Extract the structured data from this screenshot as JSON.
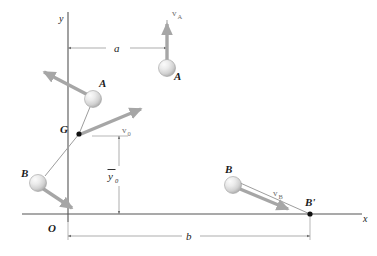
{
  "figure": {
    "background_color": "#ffffff",
    "axes": {
      "x_label": "x",
      "y_label": "y",
      "origin_label": "O",
      "axis_color": "#555555"
    },
    "points": [
      {
        "id": "G",
        "label": "G",
        "kind": "mass-center-dot",
        "x": 79,
        "y": 134
      },
      {
        "id": "Bprime",
        "label": "B'",
        "kind": "position-dot",
        "x": 310,
        "y": 216
      }
    ],
    "balls": [
      {
        "id": "ball-A-initial",
        "label": "A",
        "x": 93,
        "y": 99,
        "r": 8.5,
        "label_dx": 6,
        "label_dy": -12
      },
      {
        "id": "ball-A-final",
        "label": "A",
        "x": 167,
        "y": 68,
        "r": 8.5,
        "label_dx": 7,
        "label_dy": 12
      },
      {
        "id": "ball-B-initial",
        "label": "B",
        "x": 38,
        "y": 183,
        "r": 8.5,
        "label_dx": -17,
        "label_dy": -6
      },
      {
        "id": "ball-B-final",
        "label": "B",
        "x": 233,
        "y": 185,
        "r": 8.5,
        "label_dx": -8,
        "label_dy": -12
      }
    ],
    "vectors": [
      {
        "id": "vA",
        "label": "v",
        "subscript": "A",
        "color": "#a6a6a6",
        "label_x": 174,
        "label_y": 13
      },
      {
        "id": "v0",
        "label": "v",
        "subscript": "0",
        "color": "#a6a6a6",
        "label_x": 123,
        "label_y": 133
      },
      {
        "id": "vB",
        "label": "v",
        "subscript": "B",
        "color": "#a6a6a6",
        "label_x": 274,
        "label_y": 196
      },
      {
        "id": "vA-recoil",
        "label": "",
        "subscript": "",
        "color": "#a6a6a6",
        "label_x": 0,
        "label_y": 0
      },
      {
        "id": "vB-recoil",
        "label": "",
        "subscript": "",
        "color": "#a6a6a6",
        "label_x": 0,
        "label_y": 0
      }
    ],
    "dimensions": [
      {
        "id": "dim-a",
        "label": "a",
        "label_x": 118,
        "label_y": 45,
        "from_x": 68,
        "to_x": 167,
        "y": 48
      },
      {
        "id": "dim-b",
        "label": "b",
        "label_x": 190,
        "label_y": 240,
        "from_x": 68,
        "to_x": 310,
        "y": 236
      },
      {
        "id": "dim-y0",
        "label": "y",
        "overbar": true,
        "subscript": "0",
        "label_x": 92,
        "label_y": 178,
        "x": 119,
        "from_y": 136,
        "to_y": 214
      }
    ],
    "colors": {
      "axis": "#555555",
      "vector": "#a6a6a6",
      "dimension": "#8a8a8a",
      "ball_light": "#f2f2f2",
      "ball_mid": "#d4d4d4",
      "ball_dark": "#9a9a9a",
      "text": "#1b1b1b"
    }
  }
}
